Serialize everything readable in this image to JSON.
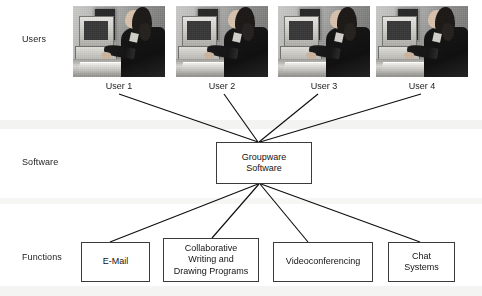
{
  "diagram": {
    "row_labels": [
      {
        "id": "users",
        "label": "Users"
      },
      {
        "id": "software",
        "label": "Software"
      },
      {
        "id": "functions",
        "label": "Functions"
      }
    ],
    "users": [
      {
        "id": "user-1",
        "caption": "User 1",
        "photo": "person-at-computer-photo"
      },
      {
        "id": "user-2",
        "caption": "User 2",
        "photo": "person-at-computer-photo"
      },
      {
        "id": "user-3",
        "caption": "User 3",
        "photo": "person-at-computer-photo"
      },
      {
        "id": "user-4",
        "caption": "User 4",
        "photo": "person-at-computer-photo"
      }
    ],
    "software": {
      "id": "groupware-software",
      "label": "Groupware\nSoftware"
    },
    "functions": [
      {
        "id": "e-mail",
        "label": "E-Mail"
      },
      {
        "id": "collaborative-writing-and-drawing-programs",
        "label": "Collaborative\nWriting and\nDrawing Programs"
      },
      {
        "id": "videoconferencing",
        "label": "Videoconferencing"
      },
      {
        "id": "chat-systems",
        "label": "Chat\nSystems"
      }
    ],
    "colors": {
      "line": "#0e0e0e",
      "box_border": "#3b3b3b",
      "text": "#141414",
      "background": "#ffffff",
      "scan_band": "#f3f3f1"
    }
  }
}
